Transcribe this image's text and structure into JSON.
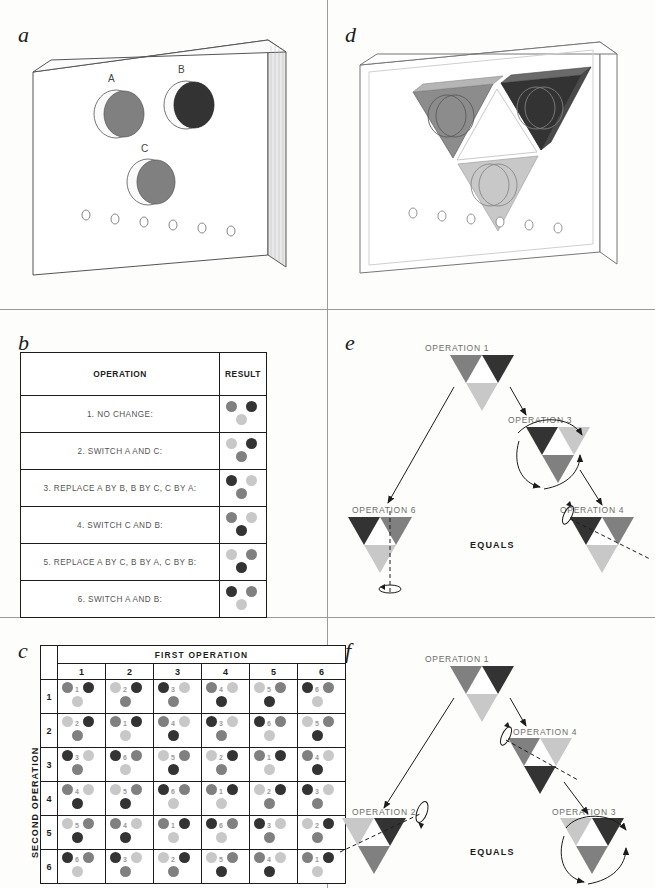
{
  "figure": {
    "panel_labels": {
      "a": "a",
      "b": "b",
      "c": "c",
      "d": "d",
      "e": "e",
      "f": "f"
    }
  },
  "colors": {
    "dark": "#333333",
    "medium": "#808080",
    "light": "#c8c8c8",
    "white": "#ffffff",
    "line": "#1c1c1c",
    "board_edge": "#555555",
    "label_gray": "#6d6d6d"
  },
  "panel_a": {
    "label": "a",
    "hole_labels": [
      "A",
      "B",
      "C"
    ],
    "disk_colors": [
      "medium",
      "dark",
      "medium"
    ],
    "peg_hole_count": 6
  },
  "panel_d": {
    "label": "d",
    "triangle_colors": {
      "top_left": "medium",
      "top_right": "dark",
      "bottom": "light",
      "center": "white"
    },
    "peg_hole_count": 6
  },
  "panel_b": {
    "label": "b",
    "headers": [
      "OPERATION",
      "RESULT"
    ],
    "rows": [
      {
        "num": "1",
        "text": "1. NO CHANGE:",
        "A": "medium",
        "B": "dark",
        "C": "light"
      },
      {
        "num": "2",
        "text": "2. SWITCH A AND C:",
        "A": "light",
        "B": "dark",
        "C": "medium"
      },
      {
        "num": "3",
        "text": "3. REPLACE A BY B, B BY C, C BY A:",
        "A": "dark",
        "B": "light",
        "C": "medium"
      },
      {
        "num": "4",
        "text": "4. SWITCH C AND B:",
        "A": "medium",
        "B": "light",
        "C": "dark"
      },
      {
        "num": "5",
        "text": "5. REPLACE A BY C, B BY A, C BY B:",
        "A": "light",
        "B": "medium",
        "C": "dark"
      },
      {
        "num": "6",
        "text": "6. SWITCH A AND B:",
        "A": "dark",
        "B": "medium",
        "C": "light"
      }
    ]
  },
  "panel_c": {
    "label": "c",
    "col_header": "FIRST OPERATION",
    "row_header": "SECOND OPERATION",
    "col_numbers": [
      "1",
      "2",
      "3",
      "4",
      "5",
      "6"
    ],
    "row_numbers": [
      "1",
      "2",
      "3",
      "4",
      "5",
      "6"
    ],
    "cayley_table": [
      [
        "1",
        "2",
        "3",
        "4",
        "5",
        "6"
      ],
      [
        "2",
        "1",
        "4",
        "3",
        "6",
        "5"
      ],
      [
        "3",
        "6",
        "5",
        "2",
        "1",
        "4"
      ],
      [
        "4",
        "5",
        "6",
        "1",
        "2",
        "3"
      ],
      [
        "5",
        "4",
        "1",
        "6",
        "3",
        "2"
      ],
      [
        "6",
        "3",
        "2",
        "5",
        "4",
        "1"
      ]
    ],
    "result_disk_colors": {
      "1": {
        "A": "medium",
        "B": "dark",
        "C": "light"
      },
      "2": {
        "A": "light",
        "B": "dark",
        "C": "medium"
      },
      "3": {
        "A": "dark",
        "B": "light",
        "C": "medium"
      },
      "4": {
        "A": "medium",
        "B": "light",
        "C": "dark"
      },
      "5": {
        "A": "light",
        "B": "medium",
        "C": "dark"
      },
      "6": {
        "A": "dark",
        "B": "medium",
        "C": "light"
      }
    }
  },
  "panel_e": {
    "label": "e",
    "equals_text": "EQUALS",
    "start_label": "OPERATION 1",
    "step_label": "OPERATION 3",
    "second_step_label": "OPERATION 4",
    "result_label": "OPERATION 6",
    "start": {
      "top_left": "medium",
      "top_right": "dark",
      "bottom": "light"
    },
    "step": {
      "top_left": "dark",
      "top_right": "light",
      "bottom": "medium"
    },
    "second_step": {
      "top_left": "dark",
      "top_right": "medium",
      "bottom": "light"
    },
    "result": {
      "top_left": "dark",
      "top_right": "medium",
      "bottom": "light"
    }
  },
  "panel_f": {
    "label": "f",
    "equals_text": "EQUALS",
    "start_label": "OPERATION 1",
    "step_label": "OPERATION 4",
    "second_step_label": "OPERATION 3",
    "result_label": "OPERATION 2",
    "start": {
      "top_left": "medium",
      "top_right": "dark",
      "bottom": "light"
    },
    "step": {
      "top_left": "medium",
      "top_right": "light",
      "bottom": "dark"
    },
    "second_step": {
      "top_left": "light",
      "top_right": "dark",
      "bottom": "medium"
    },
    "result": {
      "top_left": "light",
      "top_right": "dark",
      "bottom": "medium"
    }
  }
}
